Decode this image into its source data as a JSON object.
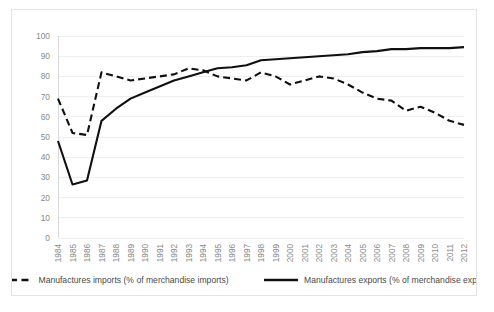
{
  "chart_data": {
    "type": "line",
    "title": "",
    "xlabel": "",
    "ylabel": "",
    "ylim": [
      0,
      100
    ],
    "yticks": [
      0,
      10,
      20,
      30,
      40,
      50,
      60,
      70,
      80,
      90,
      100
    ],
    "grid": true,
    "legend_position": "bottom",
    "categories": [
      "1984",
      "1985",
      "1986",
      "1987",
      "1988",
      "1989",
      "1990",
      "1991",
      "1992",
      "1993",
      "1994",
      "1995",
      "1996",
      "1997",
      "1998",
      "1999",
      "2000",
      "2001",
      "2002",
      "2003",
      "2004",
      "2005",
      "2006",
      "2007",
      "2008",
      "2009",
      "2010",
      "2011",
      "2012"
    ],
    "series": [
      {
        "name": "Manufactures imports (% of merchandise imports)",
        "style": "dashed",
        "color": "#101010",
        "values": [
          69,
          52,
          51,
          82,
          80,
          78,
          79,
          80,
          81,
          84,
          83,
          80,
          79,
          78,
          82,
          80,
          76,
          78,
          80,
          79,
          76,
          72,
          69,
          68,
          63,
          65,
          62,
          58,
          56
        ]
      },
      {
        "name": "Manufactures exports (% of merchandise exports)",
        "style": "solid",
        "color": "#101010",
        "values": [
          48,
          26.5,
          28.5,
          58,
          64,
          69,
          72,
          75,
          78,
          80,
          82,
          84,
          84.5,
          85.5,
          88,
          88.5,
          89,
          89.5,
          90,
          90.5,
          91,
          92,
          92.5,
          93.5,
          93.5,
          94,
          94,
          94,
          94.5
        ]
      }
    ]
  },
  "legend": {
    "items": [
      {
        "label": "Manufactures imports (% of merchandise imports)",
        "style": "dashed"
      },
      {
        "label": "Manufactures exports (% of merchandise exports)",
        "style": "solid"
      }
    ]
  }
}
